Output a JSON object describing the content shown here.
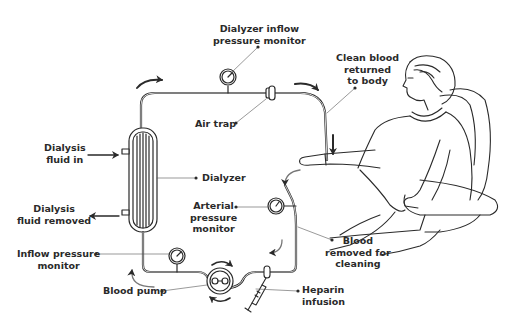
{
  "diagram": {
    "colors": {
      "line": "#2a2a2a",
      "label_text": "#2a2a2a",
      "background": "#ffffff"
    },
    "labels": {
      "dialyzer_inflow_monitor": {
        "line1": "Dialyzer inflow",
        "line2": "pressure monitor"
      },
      "clean_blood": {
        "line1": "Clean blood",
        "line2": "returned",
        "line3": "to body"
      },
      "air_trap": "Air trap",
      "dialysis_fluid_in": {
        "line1": "Dialysis",
        "line2": "fluid in"
      },
      "dialyzer": "Dialyzer",
      "dialysis_fluid_removed": {
        "line1": "Dialysis",
        "line2": "fluid removed"
      },
      "arterial_monitor": {
        "line1": "Arterial",
        "line2": "pressure",
        "line3": "monitor"
      },
      "blood_removed": {
        "line1": "Blood",
        "line2": "removed for",
        "line3": "cleaning"
      },
      "inflow_monitor": {
        "line1": "Inflow pressure",
        "line2": "monitor"
      },
      "blood_pump": "Blood pump",
      "heparin": {
        "line1": "Heparin",
        "line2": "infusion"
      }
    }
  }
}
